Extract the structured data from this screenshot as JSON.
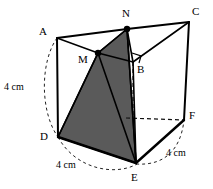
{
  "figure": {
    "type": "3d-geometry-diagram",
    "shape": "triangular-prism",
    "colors": {
      "line": "#000000",
      "shade_fill": "#5a5a5a",
      "background": "#ffffff",
      "dashed": "#333333"
    },
    "vertices": [
      {
        "id": "A",
        "label": "A",
        "x": 57,
        "y": 38,
        "label_x": 39,
        "label_y": 26,
        "dot": false
      },
      {
        "id": "N",
        "label": "N",
        "x": 127,
        "y": 29,
        "label_x": 122,
        "label_y": 8,
        "dot": true
      },
      {
        "id": "C",
        "label": "C",
        "x": 189,
        "y": 22,
        "label_x": 192,
        "label_y": 6,
        "dot": false
      },
      {
        "id": "M",
        "label": "M",
        "x": 98,
        "y": 53,
        "label_x": 78,
        "label_y": 54,
        "dot": true
      },
      {
        "id": "B",
        "label": "B",
        "x": 133,
        "y": 62,
        "label_x": 137,
        "label_y": 64,
        "dot": false
      },
      {
        "id": "D",
        "label": "D",
        "x": 58,
        "y": 137,
        "label_x": 40,
        "label_y": 131,
        "dot": false
      },
      {
        "id": "E",
        "label": "E",
        "x": 136,
        "y": 163,
        "label_x": 131,
        "label_y": 172,
        "dot": false
      },
      {
        "id": "F",
        "label": "F",
        "x": 184,
        "y": 120,
        "label_x": 189,
        "label_y": 110,
        "dot": false
      }
    ],
    "solid_edges": [
      {
        "name": "edge-A-N",
        "from": "A",
        "to": "N"
      },
      {
        "name": "edge-N-C",
        "from": "N",
        "to": "C"
      },
      {
        "name": "edge-A-M",
        "from": "A",
        "to": "M"
      },
      {
        "name": "edge-M-N",
        "from": "M",
        "to": "N"
      },
      {
        "name": "edge-M-B",
        "from": "M",
        "to": "B"
      },
      {
        "name": "edge-N-B",
        "from": "N",
        "to": "B"
      },
      {
        "name": "edge-B-C",
        "from": "B",
        "to": "C"
      },
      {
        "name": "edge-A-D",
        "from": "A",
        "to": "D"
      },
      {
        "name": "edge-C-F",
        "from": "C",
        "to": "F"
      },
      {
        "name": "edge-M-D",
        "from": "M",
        "to": "D"
      },
      {
        "name": "edge-M-E",
        "from": "M",
        "to": "E"
      },
      {
        "name": "edge-N-E",
        "from": "N",
        "to": "E"
      },
      {
        "name": "edge-D-E",
        "from": "D",
        "to": "E"
      },
      {
        "name": "edge-E-F",
        "from": "E",
        "to": "F"
      },
      {
        "name": "edge-B-E",
        "from": "B",
        "to": "E"
      }
    ],
    "hidden_edges": [
      {
        "name": "hidden-edge-B-F",
        "from": "B",
        "to": "F"
      }
    ],
    "shaded_face": {
      "name": "shaded-cross-section",
      "points": [
        "D",
        "M",
        "N",
        "E"
      ]
    },
    "right_angle_marker": {
      "name": "right-angle-marker-at-B",
      "at": "B"
    },
    "arcs": [
      {
        "name": "arc-measure-AD",
        "from": "A",
        "to": "D",
        "bulge": "left"
      },
      {
        "name": "arc-measure-DE",
        "from": "D",
        "to": "E",
        "bulge": "down"
      },
      {
        "name": "arc-measure-EF",
        "from": "E",
        "to": "F",
        "bulge": "right"
      }
    ],
    "dimensions": [
      {
        "name": "dimension-label-ad",
        "text": "4 cm",
        "x": 4,
        "y": 82
      },
      {
        "name": "dimension-label-de",
        "text": "4 cm",
        "x": 56,
        "y": 160
      },
      {
        "name": "dimension-label-ef",
        "text": "4 cm",
        "x": 166,
        "y": 148
      }
    ]
  }
}
